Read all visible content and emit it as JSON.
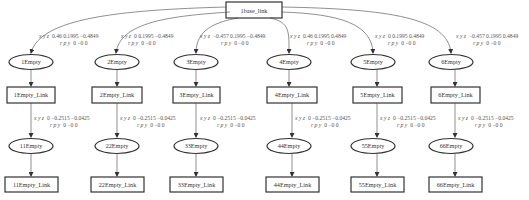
{
  "diagram": {
    "type": "tf-tree",
    "root": {
      "label": "1base_link"
    },
    "columns": [
      {
        "root_edge": {
          "xyz_label": "x y z",
          "xyz": "0.46 0.1995 −0.4849",
          "rpy_label": "r p y",
          "rpy": "0 −0 0"
        },
        "empty": "1Empty",
        "link": "1Empty_Link",
        "child_edge": {
          "xyz_label": "x y z",
          "xyz": "0 −0.2515 −0.0425",
          "rpy_label": "r p y",
          "rpy": "0 −0 0"
        },
        "child_empty": "11Empty",
        "child_link": "11Empty_Link"
      },
      {
        "root_edge": {
          "xyz_label": "x y z",
          "xyz": "0 0.1995 −0.4849",
          "rpy_label": "r p y",
          "rpy": "0 −0 0"
        },
        "empty": "2Empty",
        "link": "2Empty_Link",
        "child_edge": {
          "xyz_label": "x y z",
          "xyz": "0 −0.2515 −0.0425",
          "rpy_label": "r p y",
          "rpy": "0 −0 0"
        },
        "child_empty": "22Empty",
        "child_link": "22Empty_Link"
      },
      {
        "root_edge": {
          "xyz_label": "x y z",
          "xyz": "−0.457 0.1995 −0.4849",
          "rpy_label": "r p y",
          "rpy": "0 −0 0"
        },
        "empty": "3Empty",
        "link": "3Empty_Link",
        "child_edge": {
          "xyz_label": "x y z",
          "xyz": "0 −0.2515 −0.0425",
          "rpy_label": "r p y",
          "rpy": "0 −0 0"
        },
        "child_empty": "33Empty",
        "child_link": "33Empty_Link"
      },
      {
        "root_edge": {
          "xyz_label": "x y z",
          "xyz": "0.46 0.1995 0.4849",
          "rpy_label": "r p y",
          "rpy": "0 −0 0"
        },
        "empty": "4Empty",
        "link": "4Empty_Link",
        "child_edge": {
          "xyz_label": "x y z",
          "xyz": "0 −0.2515 −0.0425",
          "rpy_label": "r p y",
          "rpy": "0 −0 0"
        },
        "child_empty": "44Empty",
        "child_link": "44Empty_Link"
      },
      {
        "root_edge": {
          "xyz_label": "x y z",
          "xyz": "0 0.1995 0.4849",
          "rpy_label": "r p y",
          "rpy": "0 −0 0"
        },
        "empty": "5Empty",
        "link": "5Empty_Link",
        "child_edge": {
          "xyz_label": "x y z",
          "xyz": "0 −0.2515 −0.0425",
          "rpy_label": "r p y",
          "rpy": "0 −0 0"
        },
        "child_empty": "55Empty",
        "child_link": "55Empty_Link"
      },
      {
        "root_edge": {
          "xyz_label": "x y z",
          "xyz": "−0.457 0.1995 0.4849",
          "rpy_label": "r p y",
          "rpy": "0 −0 0"
        },
        "empty": "6Empty",
        "link": "6Empty_Link",
        "child_edge": {
          "xyz_label": "x y z",
          "xyz": "0 −0.2515 −0.0425",
          "rpy_label": "r p y",
          "rpy": "0 −0 0"
        },
        "child_empty": "66Empty",
        "child_link": "66Empty_Link"
      }
    ]
  }
}
